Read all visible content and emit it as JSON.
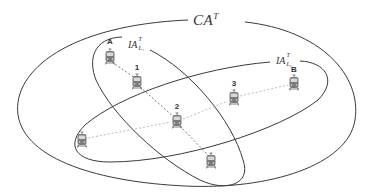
{
  "diagram": {
    "title_label": {
      "base": "CA",
      "sup": "T"
    },
    "regions": [
      {
        "id": "CA",
        "label_base": "CA",
        "label_sup": "T",
        "shape": "ellipse"
      },
      {
        "id": "IA_L1",
        "label_base": "IA",
        "label_sup": "T",
        "label_sub": "L1",
        "shape": "ellipse"
      },
      {
        "id": "IA_L2",
        "label_base": "IA",
        "label_sup": "T",
        "label_sub": "L2",
        "shape": "ellipse"
      }
    ],
    "ia1": {
      "base": "IA",
      "sup": "T",
      "sub": "L₁"
    },
    "ia2": {
      "base": "IA",
      "sup": "T",
      "sub": "L₂"
    },
    "nodes": [
      {
        "id": "A",
        "label": "A",
        "icon": "train-icon",
        "x": 110,
        "y": 57
      },
      {
        "id": "1",
        "label": "1",
        "icon": "train-icon",
        "x": 137,
        "y": 82
      },
      {
        "id": "2",
        "label": "2",
        "icon": "train-icon",
        "x": 177,
        "y": 121
      },
      {
        "id": "3",
        "label": "3",
        "icon": "train-icon",
        "x": 234,
        "y": 98
      },
      {
        "id": "B",
        "label": "B",
        "icon": "train-icon",
        "x": 294,
        "y": 83
      },
      {
        "id": "L",
        "label": "",
        "icon": "train-icon",
        "x": 82,
        "y": 140
      },
      {
        "id": "D",
        "label": "",
        "icon": "train-icon",
        "x": 211,
        "y": 161
      }
    ],
    "paths": [
      {
        "from": "A",
        "to": "1",
        "style": "dashed",
        "color": "#555555"
      },
      {
        "from": "1",
        "to": "2",
        "style": "dashed",
        "color": "#555555"
      },
      {
        "from": "2",
        "to": "D",
        "style": "dashed",
        "color": "#555555"
      },
      {
        "from": "L",
        "to": "2",
        "style": "dashed",
        "color": "#aaaaaa"
      },
      {
        "from": "2",
        "to": "3",
        "style": "dashed",
        "color": "#aaaaaa"
      },
      {
        "from": "3",
        "to": "B",
        "style": "dashed",
        "color": "#aaaaaa"
      }
    ],
    "colors": {
      "stroke": "#3a3a3a",
      "icon": "#6b6b6b",
      "background": "#ffffff"
    }
  }
}
